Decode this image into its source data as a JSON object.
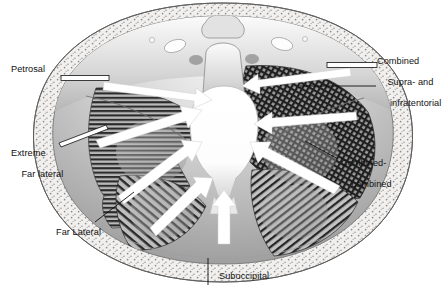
{
  "figure": {
    "type": "anatomical-illustration",
    "view": "axial cross-section of the skull base / posterior fossa",
    "background_color": "#ffffff",
    "ink_color": "#111111",
    "arrow_color": "#ffffff",
    "arrow_count": 8
  },
  "labels": {
    "petrosal": "Petrosal",
    "combined_supra_line1": "Combined",
    "combined_supra_line2": "Supra- and",
    "combined_supra_line3": " infratentorial",
    "extreme_line1": "Extreme",
    "extreme_line2": "Far lateral",
    "far_lateral": "Far Lateral",
    "combined_combined_line1": "Combined-",
    "combined_combined_line2": "combined",
    "suboccipital": "Suboccipital"
  },
  "leaders": {
    "petrosal": "horizontal-bar",
    "combined_supra_a": "horizontal-bar",
    "combined_supra_b": "horizontal-line",
    "extreme": "diagonal-bar",
    "far_lateral": "diagonal-line",
    "combined_combined": "diagonal-line",
    "suboccipital": "vertical-line"
  },
  "regions": {
    "horizontal_hatch": "Petrosal approach corridor (left)",
    "cross_hatch": "Combined supra- and infratentorial corridor (right)",
    "diagonal_hatch": "Combined-combined corridor (lower right)",
    "stipple_rim": "scalp / soft tissue rim",
    "center": "brainstem and foramen magnum"
  }
}
